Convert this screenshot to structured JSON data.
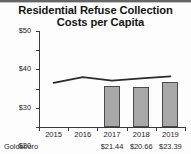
{
  "chart_data": {
    "type": "bar",
    "title": "Residential Refuse Collection Costs per Capita",
    "title_lines": [
      "Residential Refuse Collection",
      "Costs per Capita"
    ],
    "xlabel": "",
    "ylabel": "",
    "categories": [
      "2015",
      "2016",
      "2017",
      "2018",
      "2019"
    ],
    "ylim": [
      0,
      50
    ],
    "ytick_labels": [
      "$0",
      "$10",
      "$20",
      "$30",
      "$40",
      "$50"
    ],
    "ytick_values": [
      0,
      10,
      20,
      30,
      40,
      50
    ],
    "grid": false,
    "legend": "none",
    "series": [
      {
        "name": "Goldsboro",
        "render": "bar",
        "values": [
          null,
          null,
          21.44,
          20.66,
          23.39
        ],
        "value_labels": [
          "",
          "",
          "$21.44",
          "$20.66",
          "$23.39"
        ],
        "fill_color": "#a8a8a8",
        "edge_color": "#4b4b4b"
      },
      {
        "name": "Benchmark average",
        "render": "line",
        "values": [
          23.0,
          26.0,
          24.2,
          25.3,
          26.4
        ],
        "line_color": "#2b2b2b"
      }
    ]
  },
  "table": {
    "row_label": "Goldsboro",
    "cells": [
      "",
      "",
      "$21.44",
      "$20.66",
      "$23.39"
    ]
  }
}
